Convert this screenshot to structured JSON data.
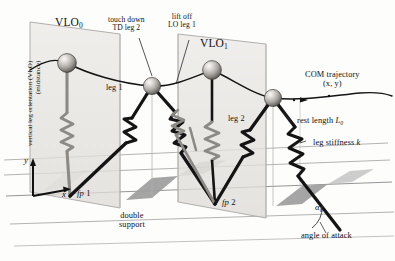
{
  "figure": {
    "type": "mechanics-diagram"
  },
  "labels": {
    "vlo_axis_line1": "vertical leg orientation (VLO)",
    "vlo_axis_line2": "(midstance)",
    "vlo_0": "VLO",
    "vlo_0_sub": "0",
    "vlo_1": "VLO",
    "vlo_1_sub": "1",
    "touchdown_line1": "touch down",
    "touchdown_line2": "TD leg 2",
    "liftoff_line1": "lift off",
    "liftoff_line2": "LO leg 1",
    "leg1": "leg 1",
    "leg2": "leg 2",
    "com_line1": "COM trajectory",
    "com_line2": "(x, y)",
    "rest_length_text": "rest length ",
    "rest_length_sym": "L",
    "rest_length_sub": "0",
    "leg_stiffness_text": "leg stiffness ",
    "leg_stiffness_sym": "k",
    "fp1_f": "f",
    "fp1_p": "p",
    "fp1_n": "1",
    "fp2_f": "f",
    "fp2_p": "p",
    "fp2_n": "2",
    "double_support_line1": "double",
    "double_support_line2": "support",
    "angle_of_attack": "angle of attack",
    "alpha_sym": "α",
    "alpha_sub": "0",
    "axis_y": "y",
    "axis_x": "x"
  },
  "colors": {
    "ink": "#111111",
    "leg": "#141414",
    "ground_line": "#9a9a9a",
    "plane_fill": "#e3e1de",
    "plane_stroke": "#a9a7a3",
    "double_support_fill": "#9d9d9d",
    "trajectory": "#141414",
    "mass_light": "#f2f0ee",
    "mass_mid": "#b8b5b1",
    "mass_dark": "#5d5b58",
    "leader": "#2b2b2b"
  },
  "geometry": {
    "masses": [
      {
        "name": "mass-vlo0",
        "cx": 67,
        "cy": 63,
        "r": 9.4
      },
      {
        "name": "mass-td-lo",
        "cx": 152,
        "cy": 86,
        "r": 8.6
      },
      {
        "name": "mass-vlo1",
        "cx": 212,
        "cy": 70,
        "r": 9.4
      },
      {
        "name": "mass-td2",
        "cx": 273,
        "cy": 98,
        "r": 8.6
      }
    ],
    "footprints": [
      {
        "name": "fp1",
        "x": 70,
        "y": 196
      },
      {
        "name": "fp2",
        "x": 215,
        "y": 204
      }
    ],
    "double_support_patches": 3
  }
}
